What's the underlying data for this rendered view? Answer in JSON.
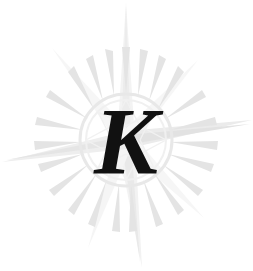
{
  "logo": {
    "name": "compass-rose-monogram",
    "monogram_letter": "K",
    "background_color": "#ffffff",
    "letter_color": "#111111",
    "watermark_colors": {
      "ray_light": "#f5f5f5",
      "ray_mid": "#ededed",
      "ray_dark": "#e2e2e2",
      "ring_stroke": "#ebebeb",
      "teeth_fill": "#e6e6e6"
    },
    "center": {
      "x": 126,
      "y": 140
    },
    "ring_radius": 46,
    "teeth_count": 24,
    "ray_count": 8,
    "rays": [
      {
        "name": "ray-north",
        "angle_deg": 0,
        "length": 140,
        "half_width": 9,
        "tone": "ray_light"
      },
      {
        "name": "ray-northeast",
        "angle_deg": 45,
        "length": 96,
        "half_width": 6,
        "tone": "ray_light"
      },
      {
        "name": "ray-east",
        "angle_deg": 90,
        "length": 132,
        "half_width": 10,
        "tone": "ray_dark"
      },
      {
        "name": "ray-southeast",
        "angle_deg": 135,
        "length": 92,
        "half_width": 6,
        "tone": "ray_light"
      },
      {
        "name": "ray-south",
        "angle_deg": 180,
        "length": 138,
        "half_width": 9,
        "tone": "ray_mid"
      },
      {
        "name": "ray-southwest",
        "angle_deg": 225,
        "length": 100,
        "half_width": 6,
        "tone": "ray_light"
      },
      {
        "name": "ray-west",
        "angle_deg": 270,
        "length": 128,
        "half_width": 10,
        "tone": "ray_mid"
      },
      {
        "name": "ray-northwest",
        "angle_deg": 315,
        "length": 104,
        "half_width": 6,
        "tone": "ray_light"
      }
    ],
    "letter_position": {
      "x": 126,
      "y": 174
    }
  }
}
